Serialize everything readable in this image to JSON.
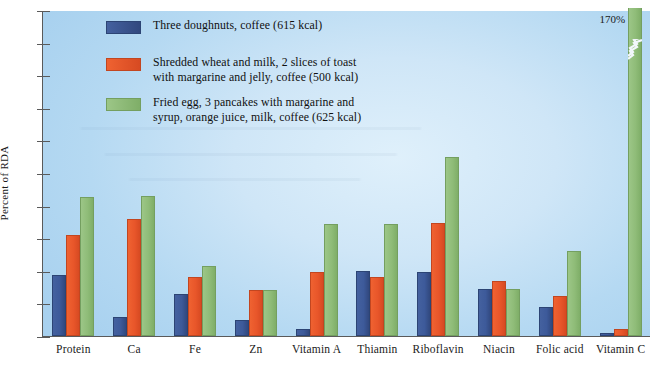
{
  "chart_data": {
    "type": "bar",
    "title": "",
    "xlabel": "",
    "ylabel": "Percent of RDA",
    "ylim": [
      0,
      100
    ],
    "yticks": [
      0,
      10,
      20,
      30,
      40,
      50,
      60,
      70,
      80,
      90,
      100
    ],
    "grid": false,
    "legend_position": "top-left",
    "categories": [
      "Protein",
      "Ca",
      "Fe",
      "Zn",
      "Vitamin A",
      "Thiamin",
      "Riboflavin",
      "Niacin",
      "Folic acid",
      "Vitamin C"
    ],
    "series": [
      {
        "name": "Three doughnuts, coffee (615 kcal)",
        "color": "#3d5a9a",
        "values": [
          18.7,
          5.7,
          13.0,
          5.0,
          2.0,
          20.0,
          19.5,
          14.5,
          9.0,
          1.0
        ]
      },
      {
        "name": "Shredded wheat and milk, 2 slices of toast with margarine and jelly, coffee (500 kcal)",
        "color": "#e8562a",
        "values": [
          31.0,
          36.0,
          18.0,
          14.2,
          19.5,
          18.0,
          34.7,
          17.0,
          12.3,
          2.0
        ]
      },
      {
        "name": "Fried egg, 3 pancakes with margarine and syrup, orange juice, milk, coffee (625 kcal)",
        "color": "#8fbc78",
        "values": [
          42.5,
          43.0,
          21.5,
          14.2,
          34.5,
          34.5,
          55.0,
          14.5,
          26.0,
          170.0
        ]
      }
    ],
    "annotations": [
      {
        "text": "170%",
        "category": "Vitamin C",
        "series": "Fried egg, 3 pancakes with margarine and syrup, orange juice, milk, coffee (625 kcal)",
        "note": "bar exceeds axis maximum; drawn with axis-break mark"
      }
    ]
  },
  "legend": {
    "items": [
      {
        "label": "Three doughnuts, coffee (615 kcal)",
        "color": "#3d5a9a"
      },
      {
        "label": "Shredded wheat and milk, 2 slices of toast\nwith margarine and jelly, coffee (500 kcal)",
        "color": "#e8562a"
      },
      {
        "label": "Fried egg, 3 pancakes with margarine and\nsyrup, orange juice, milk, coffee (625 kcal)",
        "color": "#8fbc78"
      }
    ]
  },
  "axes": {
    "y_title": "Percent of RDA",
    "y_tick_labels": [
      "0",
      "10",
      "20",
      "30",
      "40",
      "50",
      "60",
      "70",
      "80",
      "90",
      "100"
    ],
    "x_tick_labels": [
      "Protein",
      "Ca",
      "Fe",
      "Zn",
      "Vitamin A",
      "Thiamin",
      "Riboflavin",
      "Niacin",
      "Folic acid",
      "Vitamin C"
    ]
  },
  "clipped_bar_label": "170%"
}
